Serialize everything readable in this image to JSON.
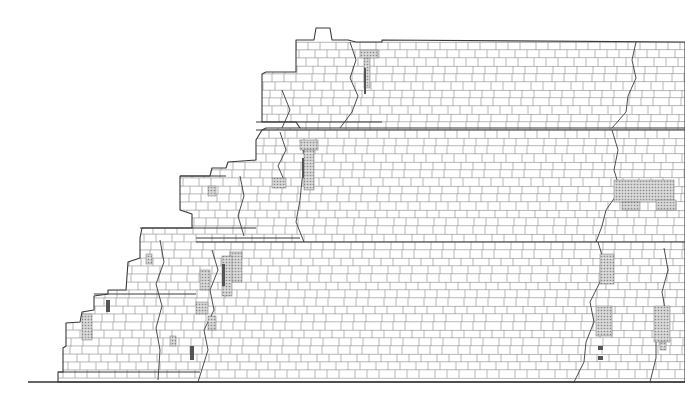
{
  "drawing": {
    "kind": "architectural elevation of stepped masonry structure",
    "width": 685,
    "height": 409,
    "colors": {
      "background": "#ffffff",
      "outline": "#3a3a3a",
      "joint": "#8a8a8a",
      "course": "#9a9a9a",
      "hatch": "#a8a8a8",
      "dark_block": "#555555",
      "ground": "#333333"
    },
    "ground_line": {
      "x1": 28,
      "x2": 685,
      "y": 382
    },
    "outline": [
      [
        58,
        382
      ],
      [
        58,
        372
      ],
      [
        63,
        372
      ],
      [
        63,
        348
      ],
      [
        66,
        346
      ],
      [
        66,
        323
      ],
      [
        80,
        322
      ],
      [
        82,
        312
      ],
      [
        94,
        310
      ],
      [
        94,
        296
      ],
      [
        108,
        294
      ],
      [
        108,
        290
      ],
      [
        126,
        290
      ],
      [
        128,
        262
      ],
      [
        140,
        258
      ],
      [
        140,
        238
      ],
      [
        142,
        228
      ],
      [
        192,
        228
      ],
      [
        192,
        214
      ],
      [
        180,
        210
      ],
      [
        180,
        176
      ],
      [
        210,
        176
      ],
      [
        212,
        168
      ],
      [
        226,
        168
      ],
      [
        228,
        162
      ],
      [
        256,
        160
      ],
      [
        256,
        140
      ],
      [
        262,
        130
      ],
      [
        266,
        128
      ],
      [
        300,
        128
      ],
      [
        296,
        122
      ],
      [
        262,
        122
      ],
      [
        262,
        74
      ],
      [
        266,
        72
      ],
      [
        296,
        72
      ],
      [
        296,
        40
      ],
      [
        314,
        40
      ],
      [
        316,
        28
      ],
      [
        330,
        28
      ],
      [
        332,
        40
      ],
      [
        348,
        40
      ],
      [
        356,
        42
      ],
      [
        382,
        42
      ],
      [
        382,
        40
      ],
      [
        685,
        42
      ],
      [
        685,
        382
      ]
    ],
    "main_block": {
      "courses_y": [
        42,
        50,
        58,
        66,
        74,
        82,
        90,
        98,
        106,
        114,
        122,
        130,
        138,
        146,
        154,
        162,
        170,
        178,
        186,
        194,
        202,
        210,
        218,
        226,
        234,
        242,
        250,
        258,
        266,
        274,
        282,
        290,
        298,
        306,
        314,
        322,
        330,
        338,
        346,
        354,
        362,
        370,
        378
      ],
      "band_lines": [
        {
          "x1": 256,
          "x2": 685,
          "y": 130
        },
        {
          "x1": 196,
          "x2": 685,
          "y": 242
        },
        {
          "x1": 300,
          "x2": 685,
          "y": 128
        }
      ],
      "joint_spacing": 12
    },
    "cracks": [
      [
        [
          350,
          42
        ],
        [
          356,
          60
        ],
        [
          350,
          78
        ],
        [
          358,
          96
        ],
        [
          352,
          112
        ],
        [
          340,
          128
        ]
      ],
      [
        [
          636,
          42
        ],
        [
          632,
          60
        ],
        [
          636,
          78
        ],
        [
          628,
          96
        ],
        [
          626,
          112
        ],
        [
          612,
          128
        ]
      ],
      [
        [
          612,
          130
        ],
        [
          618,
          150
        ],
        [
          614,
          170
        ],
        [
          620,
          190
        ],
        [
          606,
          210
        ],
        [
          602,
          226
        ],
        [
          596,
          242
        ]
      ],
      [
        [
          598,
          242
        ],
        [
          604,
          262
        ],
        [
          600,
          282
        ],
        [
          590,
          302
        ],
        [
          594,
          322
        ],
        [
          586,
          342
        ],
        [
          584,
          362
        ],
        [
          574,
          382
        ]
      ],
      [
        [
          664,
          248
        ],
        [
          668,
          270
        ],
        [
          662,
          292
        ],
        [
          666,
          314
        ],
        [
          656,
          336
        ],
        [
          656,
          358
        ],
        [
          650,
          382
        ]
      ],
      [
        [
          300,
          140
        ],
        [
          306,
          160
        ],
        [
          302,
          180
        ],
        [
          300,
          200
        ],
        [
          296,
          222
        ],
        [
          304,
          242
        ]
      ],
      [
        [
          212,
          250
        ],
        [
          218,
          270
        ],
        [
          210,
          290
        ],
        [
          214,
          310
        ],
        [
          204,
          330
        ],
        [
          208,
          350
        ],
        [
          198,
          382
        ]
      ],
      [
        [
          160,
          240
        ],
        [
          164,
          262
        ],
        [
          156,
          284
        ],
        [
          162,
          306
        ],
        [
          156,
          328
        ],
        [
          160,
          350
        ],
        [
          158,
          380
        ]
      ],
      [
        [
          240,
          176
        ],
        [
          244,
          196
        ],
        [
          238,
          216
        ],
        [
          244,
          236
        ]
      ],
      [
        [
          280,
          132
        ],
        [
          286,
          150
        ],
        [
          278,
          166
        ],
        [
          284,
          180
        ]
      ],
      [
        [
          282,
          90
        ],
        [
          290,
          110
        ],
        [
          282,
          128
        ]
      ]
    ],
    "hatched_blocks": [
      {
        "x": 360,
        "y": 50,
        "w": 18,
        "h": 8
      },
      {
        "x": 364,
        "y": 58,
        "w": 6,
        "h": 30
      },
      {
        "x": 300,
        "y": 140,
        "w": 18,
        "h": 10
      },
      {
        "x": 304,
        "y": 150,
        "w": 10,
        "h": 40
      },
      {
        "x": 272,
        "y": 178,
        "w": 14,
        "h": 10
      },
      {
        "x": 208,
        "y": 186,
        "w": 8,
        "h": 10
      },
      {
        "x": 614,
        "y": 180,
        "w": 60,
        "h": 22
      },
      {
        "x": 622,
        "y": 202,
        "w": 18,
        "h": 8
      },
      {
        "x": 656,
        "y": 200,
        "w": 20,
        "h": 10
      },
      {
        "x": 230,
        "y": 252,
        "w": 12,
        "h": 30
      },
      {
        "x": 222,
        "y": 256,
        "w": 10,
        "h": 40
      },
      {
        "x": 200,
        "y": 270,
        "w": 10,
        "h": 20
      },
      {
        "x": 196,
        "y": 302,
        "w": 12,
        "h": 12
      },
      {
        "x": 146,
        "y": 254,
        "w": 6,
        "h": 10
      },
      {
        "x": 82,
        "y": 314,
        "w": 10,
        "h": 26
      },
      {
        "x": 170,
        "y": 336,
        "w": 6,
        "h": 10
      },
      {
        "x": 600,
        "y": 254,
        "w": 14,
        "h": 30
      },
      {
        "x": 596,
        "y": 306,
        "w": 16,
        "h": 30
      },
      {
        "x": 654,
        "y": 306,
        "w": 16,
        "h": 36
      },
      {
        "x": 660,
        "y": 342,
        "w": 6,
        "h": 8
      },
      {
        "x": 208,
        "y": 316,
        "w": 8,
        "h": 14
      }
    ],
    "dark_blocks": [
      {
        "x": 106,
        "y": 300,
        "w": 4,
        "h": 12
      },
      {
        "x": 190,
        "y": 346,
        "w": 4,
        "h": 14
      },
      {
        "x": 598,
        "y": 346,
        "w": 5,
        "h": 4
      },
      {
        "x": 598,
        "y": 356,
        "w": 5,
        "h": 4
      },
      {
        "x": 364,
        "y": 68,
        "w": 2,
        "h": 26
      },
      {
        "x": 302,
        "y": 158,
        "w": 2,
        "h": 20
      },
      {
        "x": 222,
        "y": 264,
        "w": 3,
        "h": 22
      }
    ],
    "step_ledges": [
      {
        "x1": 256,
        "x2": 382,
        "y": 122
      },
      {
        "x1": 140,
        "x2": 256,
        "y": 228
      },
      {
        "x1": 196,
        "x2": 300,
        "y": 238
      },
      {
        "x1": 94,
        "x2": 196,
        "y": 294
      },
      {
        "x1": 58,
        "x2": 200,
        "y": 372
      },
      {
        "x1": 180,
        "x2": 226,
        "y": 176
      }
    ],
    "text_labels": []
  }
}
